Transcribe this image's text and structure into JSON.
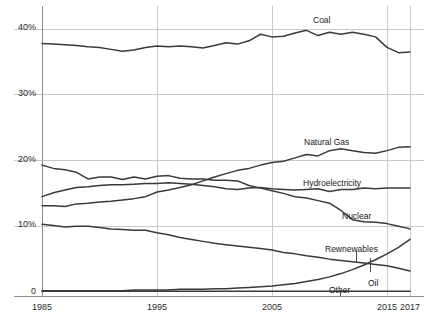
{
  "chart_data": {
    "type": "line",
    "title": "",
    "subtitle": "",
    "xlabel": "",
    "ylabel": "",
    "xlim": [
      1985,
      2017
    ],
    "ylim": [
      0,
      42
    ],
    "grid": true,
    "legend_position": "inline-labels",
    "y_tick_labels": [
      "40%",
      "30%",
      "20%",
      "10%",
      "0"
    ],
    "y_tick_values": [
      40,
      30,
      20,
      10,
      0
    ],
    "x_tick_labels": [
      "1985",
      "1995",
      "2005",
      "2015",
      "2017"
    ],
    "x_tick_values": [
      1985,
      1995,
      2005,
      2015,
      2017
    ],
    "x": [
      1985,
      1986,
      1987,
      1988,
      1989,
      1990,
      1991,
      1992,
      1993,
      1994,
      1995,
      1996,
      1997,
      1998,
      1999,
      2000,
      2001,
      2002,
      2003,
      2004,
      2005,
      2006,
      2007,
      2008,
      2009,
      2010,
      2011,
      2012,
      2013,
      2014,
      2015,
      2016,
      2017
    ],
    "series": [
      {
        "name": "Coal",
        "label": "Coal",
        "label_x": 313,
        "label_y": 16,
        "color": "#3a3a3a",
        "values": [
          37.8,
          37.7,
          37.6,
          37.5,
          37.3,
          37.2,
          36.9,
          36.6,
          36.8,
          37.2,
          37.4,
          37.3,
          37.4,
          37.3,
          37.1,
          37.5,
          37.9,
          37.7,
          38.2,
          39.2,
          38.8,
          38.9,
          39.4,
          39.8,
          39.0,
          39.5,
          39.2,
          39.5,
          39.2,
          38.8,
          37.2,
          36.4,
          36.5
        ]
      },
      {
        "name": "Natural Gas",
        "label": "Natural Gas",
        "label_x": 304,
        "label_y": 138,
        "color": "#3a3a3a",
        "values": [
          13.1,
          13.1,
          13.0,
          13.4,
          13.5,
          13.7,
          13.8,
          14.0,
          14.2,
          14.5,
          15.2,
          15.5,
          15.9,
          16.3,
          16.9,
          17.5,
          18.0,
          18.5,
          18.8,
          19.3,
          19.7,
          19.9,
          20.4,
          20.9,
          20.7,
          21.5,
          21.8,
          21.5,
          21.2,
          21.1,
          21.5,
          22.0,
          22.1
        ]
      },
      {
        "name": "Hydroelectricity",
        "label": "Hydroelectricity",
        "label_x": 303,
        "label_y": 179,
        "color": "#3a3a3a",
        "values": [
          14.5,
          15.1,
          15.5,
          15.9,
          16.0,
          16.2,
          16.3,
          16.3,
          16.4,
          16.5,
          16.5,
          16.6,
          16.5,
          16.4,
          16.2,
          16.0,
          15.7,
          15.6,
          15.8,
          15.9,
          15.7,
          15.6,
          15.5,
          15.6,
          15.7,
          15.3,
          15.6,
          15.6,
          15.8,
          15.7,
          15.8,
          15.8,
          15.8
        ]
      },
      {
        "name": "Nuclear",
        "label": "Nuclear",
        "label_x": 342,
        "label_y": 212,
        "color": "#3a3a3a",
        "values": [
          19.3,
          18.8,
          18.6,
          18.2,
          17.2,
          17.5,
          17.5,
          17.1,
          17.5,
          17.2,
          17.6,
          17.7,
          17.3,
          17.2,
          17.2,
          17.0,
          17.0,
          16.9,
          16.2,
          15.8,
          15.4,
          15.0,
          14.5,
          14.3,
          13.9,
          13.5,
          12.4,
          11.0,
          10.7,
          10.6,
          10.4,
          10.0,
          9.6
        ]
      },
      {
        "name": "Oil",
        "label": "Oil",
        "label_x": 368,
        "label_y": 279,
        "label_tick_x": 370,
        "label_tick_y0": 258,
        "label_tick_y1": 272,
        "color": "#3a3a3a",
        "values": [
          10.3,
          10.1,
          9.9,
          10.0,
          10.0,
          9.8,
          9.6,
          9.5,
          9.4,
          9.4,
          9.0,
          8.7,
          8.3,
          8.0,
          7.7,
          7.4,
          7.2,
          7.0,
          6.8,
          6.6,
          6.4,
          6.0,
          5.8,
          5.5,
          5.3,
          5.0,
          4.8,
          4.6,
          4.4,
          4.2,
          4.0,
          3.6,
          3.2
        ]
      },
      {
        "name": "Rewnewables",
        "label": "Rewnewables",
        "label_x": 325,
        "label_y": 245,
        "label_tick_x": 356,
        "label_tick_y0": 251,
        "label_tick_y1": 263,
        "color": "#3a3a3a",
        "values": [
          0.2,
          0.2,
          0.2,
          0.2,
          0.2,
          0.2,
          0.2,
          0.2,
          0.3,
          0.3,
          0.3,
          0.3,
          0.4,
          0.4,
          0.4,
          0.5,
          0.5,
          0.6,
          0.7,
          0.8,
          0.9,
          1.1,
          1.3,
          1.6,
          1.9,
          2.3,
          2.8,
          3.4,
          4.1,
          4.9,
          5.8,
          6.8,
          8.0
        ]
      },
      {
        "name": "Other",
        "label": "Other",
        "label_x": 329,
        "label_y": 286,
        "label_tick_x": 340,
        "label_tick_y0": 290,
        "label_tick_y1": 296,
        "color": "#3a3a3a",
        "values": [
          0.1,
          0.1,
          0.1,
          0.1,
          0.1,
          0.1,
          0.1,
          0.1,
          0.1,
          0.1,
          0.1,
          0.1,
          0.1,
          0.1,
          0.1,
          0.1,
          0.1,
          0.1,
          0.1,
          0.1,
          0.1,
          0.1,
          0.1,
          0.1,
          0.1,
          0.1,
          0.1,
          0.1,
          0.1,
          0.1,
          0.1,
          0.1,
          0.1
        ]
      }
    ],
    "colors": {
      "line": "#3a3a3a",
      "grid": "#c9c9c9",
      "axis": "#9a9a9a",
      "text": "#1f1f1f",
      "background": "#ffffff"
    }
  }
}
